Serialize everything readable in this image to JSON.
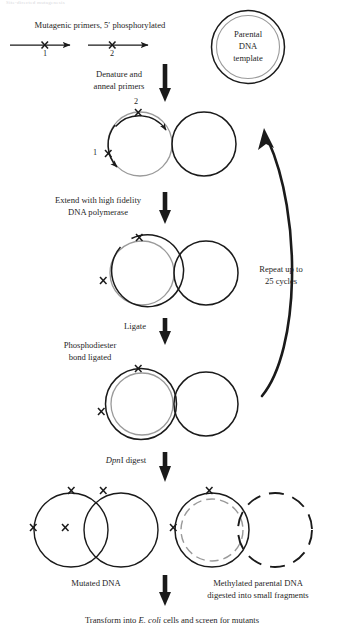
{
  "figure": {
    "title_fragment": "Site-directed mutagenesis",
    "headers": {
      "primers": "Mutagenic primers, 5′ phosphorylated",
      "primer_1_label": "1",
      "primer_2_label": "2"
    },
    "template_circle": {
      "line1": "Parental",
      "line2": "DNA",
      "line3": "template"
    },
    "steps": [
      {
        "id": "denature",
        "line1": "Denature and",
        "line2": "anneal primers"
      },
      {
        "id": "extend",
        "line1": "Extend with high fidelity",
        "line2": "DNA polymerase"
      },
      {
        "id": "ligate",
        "line1": "Ligate",
        "line2": ""
      },
      {
        "id": "phosphodiester",
        "line1": "Phosphodiester",
        "line2": "bond ligated"
      },
      {
        "id": "dpni",
        "line1": "DpnI digest",
        "line2": "",
        "italic_prefix": "Dpn",
        "roman_suffix": "I digest"
      }
    ],
    "cycle_note": {
      "line1": "Repeat up to",
      "line2": "25 cycles"
    },
    "annealed_labels": {
      "primer_2": "2",
      "primer_1": "1"
    },
    "results": {
      "left": {
        "line1": "Mutated DNA",
        "line2": ""
      },
      "right": {
        "line1": "Methylated parental DNA",
        "line2": "digested into small fragments"
      }
    },
    "footer": {
      "pre": "Transform into ",
      "italic": "E. coli",
      "post": " cells and screen for mutants"
    },
    "colors": {
      "stroke_dark": "#1a1a1a",
      "stroke_gray": "#9a9a9a",
      "background": "#ffffff",
      "text": "#1f1f1f"
    }
  }
}
